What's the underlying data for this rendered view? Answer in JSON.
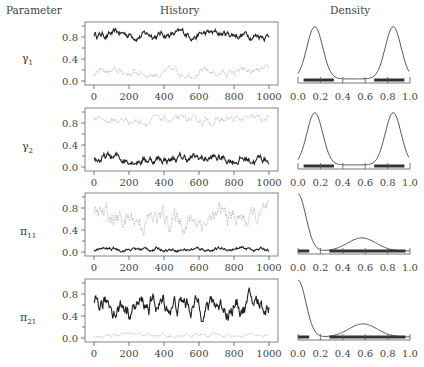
{
  "headers": {
    "parameter": "Parameter",
    "history": "History",
    "density": "Density"
  },
  "params": [
    {
      "sym": "γ",
      "sub": "1"
    },
    {
      "sym": "γ",
      "sub": "2"
    },
    {
      "sym": "π",
      "sub": "11"
    },
    {
      "sym": "π",
      "sub": "21"
    }
  ],
  "chart_data": [
    {
      "type": "line",
      "title": "History",
      "xlabel": "Iteration",
      "ylabel": "",
      "xlim": [
        0,
        1000
      ],
      "ylim": [
        0,
        1.0
      ],
      "xticks": [
        0,
        200,
        400,
        600,
        800,
        1000
      ],
      "yticks": [
        0.0,
        0.4,
        0.8
      ],
      "panels": [
        {
          "param": "gamma_1",
          "series": [
            {
              "name": "chain 1 (dark)",
              "mean": 0.85,
              "range": [
                0.7,
                0.95
              ]
            },
            {
              "name": "chain 2 (light)",
              "mean": 0.15,
              "range": [
                0.05,
                0.3
              ]
            }
          ]
        },
        {
          "param": "gamma_2",
          "series": [
            {
              "name": "chain 1 (dark)",
              "mean": 0.15,
              "range": [
                0.05,
                0.35
              ]
            },
            {
              "name": "chain 2 (light)",
              "mean": 0.85,
              "range": [
                0.7,
                0.95
              ]
            }
          ]
        },
        {
          "param": "pi_11",
          "series": [
            {
              "name": "chain 1 (dark)",
              "mean": 0.05,
              "range": [
                0.0,
                0.12
              ]
            },
            {
              "name": "chain 2 (light)",
              "mean": 0.6,
              "range": [
                0.3,
                0.95
              ]
            }
          ]
        },
        {
          "param": "pi_21",
          "series": [
            {
              "name": "chain 1 (dark)",
              "mean": 0.6,
              "range": [
                0.3,
                0.95
              ]
            },
            {
              "name": "chain 2 (light)",
              "mean": 0.05,
              "range": [
                0.0,
                0.12
              ]
            }
          ]
        }
      ]
    },
    {
      "type": "line",
      "title": "Density",
      "xlim": [
        0,
        1.0
      ],
      "xticks": [
        0.0,
        0.2,
        0.4,
        0.6,
        0.8,
        1.0
      ],
      "panels": [
        {
          "param": "gamma_1",
          "shape": "bimodal",
          "peaks": [
            0.15,
            0.85
          ]
        },
        {
          "param": "gamma_2",
          "shape": "bimodal",
          "peaks": [
            0.15,
            0.85
          ]
        },
        {
          "param": "pi_11",
          "shape": "decay + bump",
          "peaks": [
            0.0,
            0.57
          ]
        },
        {
          "param": "pi_21",
          "shape": "decay + bump",
          "peaks": [
            0.0,
            0.58
          ]
        }
      ]
    }
  ]
}
